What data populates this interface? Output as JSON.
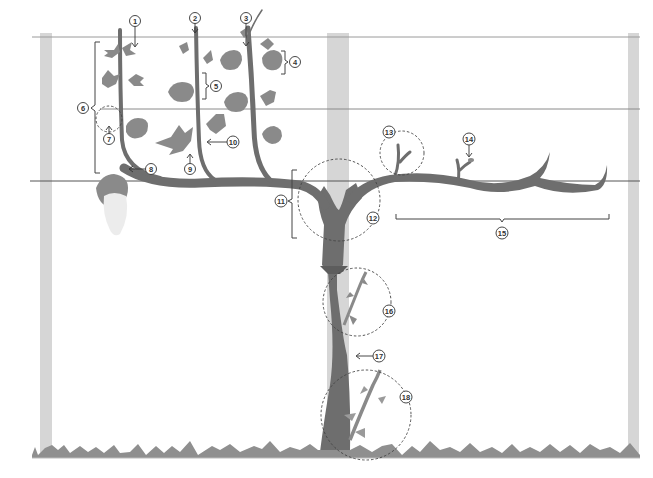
{
  "diagram": {
    "colors": {
      "background": "#ffffff",
      "post": "#d6d6d6",
      "wire": "#555555",
      "vine": "#6e6e6e",
      "leaf": "#8a8a8a",
      "grape_cluster": "#ececec",
      "grass": "#8f8f8f",
      "callout_stroke": "#333333",
      "dashed_circle": "#444444"
    },
    "trellis": {
      "posts": [
        {
          "id": "post-left",
          "x": 40,
          "width": 12
        },
        {
          "id": "post-center",
          "x": 327,
          "width": 22
        },
        {
          "id": "post-right",
          "x": 628,
          "width": 11
        }
      ],
      "wires": [
        {
          "id": "wire-top",
          "y": 37
        },
        {
          "id": "wire-middle",
          "y": 109
        },
        {
          "id": "wire-cordon",
          "y": 181
        }
      ]
    },
    "callouts": [
      {
        "id": 1,
        "label": "1",
        "x": 135,
        "y": 21
      },
      {
        "id": 2,
        "label": "2",
        "x": 195,
        "y": 18
      },
      {
        "id": 3,
        "label": "3",
        "x": 246,
        "y": 18
      },
      {
        "id": 4,
        "label": "4",
        "x": 295,
        "y": 62
      },
      {
        "id": 5,
        "label": "5",
        "x": 216,
        "y": 84
      },
      {
        "id": 6,
        "label": "6",
        "x": 83,
        "y": 108
      },
      {
        "id": 7,
        "label": "7",
        "x": 109,
        "y": 139
      },
      {
        "id": 8,
        "label": "8",
        "x": 151,
        "y": 169
      },
      {
        "id": 9,
        "label": "9",
        "x": 190,
        "y": 169
      },
      {
        "id": 10,
        "label": "10",
        "x": 233,
        "y": 142
      },
      {
        "id": 11,
        "label": "11",
        "x": 281,
        "y": 201
      },
      {
        "id": 12,
        "label": "12",
        "x": 373,
        "y": 218
      },
      {
        "id": 13,
        "label": "13",
        "x": 389,
        "y": 132
      },
      {
        "id": 14,
        "label": "14",
        "x": 469,
        "y": 139
      },
      {
        "id": 15,
        "label": "15",
        "x": 502,
        "y": 233
      },
      {
        "id": 16,
        "label": "16",
        "x": 389,
        "y": 311
      },
      {
        "id": 17,
        "label": "17",
        "x": 378,
        "y": 356
      },
      {
        "id": 18,
        "label": "18",
        "x": 406,
        "y": 397
      }
    ],
    "regions": {
      "dashed_circles": [
        {
          "id": "circle-7",
          "cx": 109,
          "cy": 119,
          "r": 13
        },
        {
          "id": "circle-12",
          "cx": 339,
          "cy": 200,
          "r": 41
        },
        {
          "id": "circle-13",
          "cx": 402,
          "cy": 153,
          "r": 22
        },
        {
          "id": "circle-16",
          "cx": 357,
          "cy": 302,
          "r": 34
        },
        {
          "id": "circle-18",
          "cx": 366,
          "cy": 415,
          "r": 45
        }
      ],
      "brackets": [
        {
          "id": "bracket-6",
          "side": "left",
          "x": 96,
          "y1": 42,
          "y2": 173
        },
        {
          "id": "bracket-4",
          "side": "right",
          "x": 285,
          "y1": 51,
          "y2": 74
        },
        {
          "id": "bracket-5",
          "side": "right",
          "x": 206,
          "y1": 73,
          "y2": 99
        },
        {
          "id": "bracket-11",
          "side": "left",
          "x": 292,
          "y1": 170,
          "y2": 238
        },
        {
          "id": "bracket-15",
          "side": "bottom",
          "x1": 396,
          "x2": 609,
          "y": 219
        }
      ]
    }
  }
}
